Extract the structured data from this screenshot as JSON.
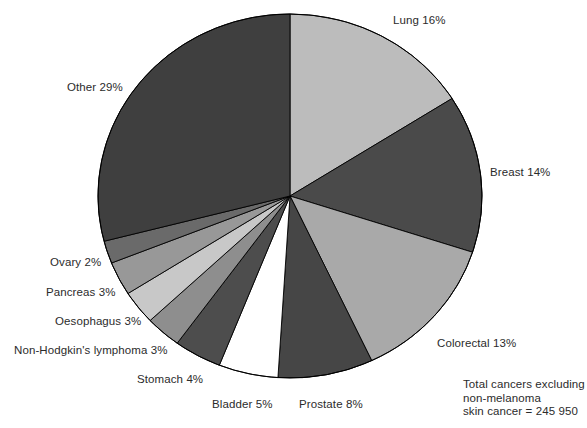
{
  "chart_data": {
    "type": "pie",
    "title": "",
    "subtitle": "",
    "xlabel": "",
    "ylabel": "",
    "legend_position": "none",
    "grid": false,
    "units": "percent",
    "start_angle_deg": 0,
    "direction": "clockwise",
    "categories": [
      "Lung",
      "Breast",
      "Colorectal",
      "Prostate",
      "Bladder",
      "Stomach",
      "Non-Hodgkin's lymphoma",
      "Oesophagus",
      "Pancreas",
      "Ovary",
      "Other"
    ],
    "values": [
      16,
      14,
      13,
      8,
      5,
      4,
      3,
      3,
      3,
      2,
      29
    ],
    "slices": [
      {
        "name": "Lung",
        "value": 16,
        "label": "Lung 16%",
        "color": "#bcbcbc"
      },
      {
        "name": "Breast",
        "value": 14,
        "label": "Breast 14%",
        "color": "#4a4a4a"
      },
      {
        "name": "Colorectal",
        "value": 13,
        "label": "Colorectal 13%",
        "color": "#a9a9a9"
      },
      {
        "name": "Prostate",
        "value": 8,
        "label": "Prostate 8%",
        "color": "#464646"
      },
      {
        "name": "Bladder",
        "value": 5,
        "label": "Bladder 5%",
        "color": "#ffffff"
      },
      {
        "name": "Stomach",
        "value": 4,
        "label": "Stomach 4%",
        "color": "#4d4d4d"
      },
      {
        "name": "Non-Hodgkin's lymphoma",
        "value": 3,
        "label": "Non-Hodgkin's lymphoma 3%",
        "color": "#8e8e8e"
      },
      {
        "name": "Oesophagus",
        "value": 3,
        "label": "Oesophagus 3%",
        "color": "#c8c8c8"
      },
      {
        "name": "Pancreas",
        "value": 3,
        "label": "Pancreas 3%",
        "color": "#989898"
      },
      {
        "name": "Ovary",
        "value": 2,
        "label": "Ovary 2%",
        "color": "#6a6a6a"
      },
      {
        "name": "Other",
        "value": 29,
        "label": "Other 29%",
        "color": "#3f3f3f"
      }
    ],
    "annotations": [
      "Total cancers excluding",
      "non-melanoma",
      "skin cancer = 245 950"
    ]
  },
  "labels": {
    "lung": "Lung 16%",
    "breast": "Breast 14%",
    "colorectal": "Colorectal 13%",
    "prostate": "Prostate 8%",
    "bladder": "Bladder 5%",
    "stomach": "Stomach 4%",
    "non_hodgkins": "Non-Hodgkin's lymphoma 3%",
    "oesophagus": "Oesophagus 3%",
    "pancreas": "Pancreas 3%",
    "ovary": "Ovary 2%",
    "other": "Other 29%"
  },
  "footnote": {
    "text": "Total cancers excluding\nnon-melanoma\nskin cancer = 245 950"
  },
  "geometry": {
    "cx": 290,
    "cy": 196,
    "rx": 192,
    "ry": 182,
    "outline_color": "#000000",
    "outline_width": 1
  }
}
